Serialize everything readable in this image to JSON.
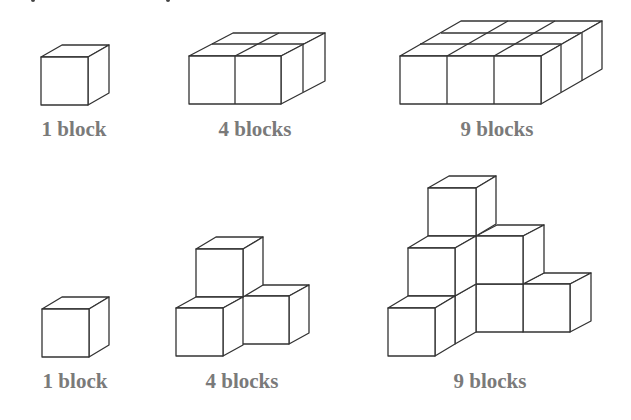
{
  "diagram": {
    "title": "",
    "rows": [
      {
        "name": "flat-arrangements",
        "figures": [
          {
            "label": "1 block",
            "count": 1,
            "arrangement": "single cube"
          },
          {
            "label": "4 blocks",
            "count": 4,
            "arrangement": "2x2 flat slab"
          },
          {
            "label": "9 blocks",
            "count": 9,
            "arrangement": "3x3 flat slab"
          }
        ]
      },
      {
        "name": "staircase-arrangements",
        "figures": [
          {
            "label": "1 block",
            "count": 1,
            "arrangement": "single cube"
          },
          {
            "label": "4 blocks",
            "count": 4,
            "arrangement": "corner stack, 3 base + 1 on top"
          },
          {
            "label": "9 blocks",
            "count": 9,
            "arrangement": "corner staircase, 3 levels"
          }
        ]
      }
    ],
    "colors": {
      "stroke": "#333333",
      "label": "#7a7a7a",
      "background": "#ffffff"
    }
  }
}
